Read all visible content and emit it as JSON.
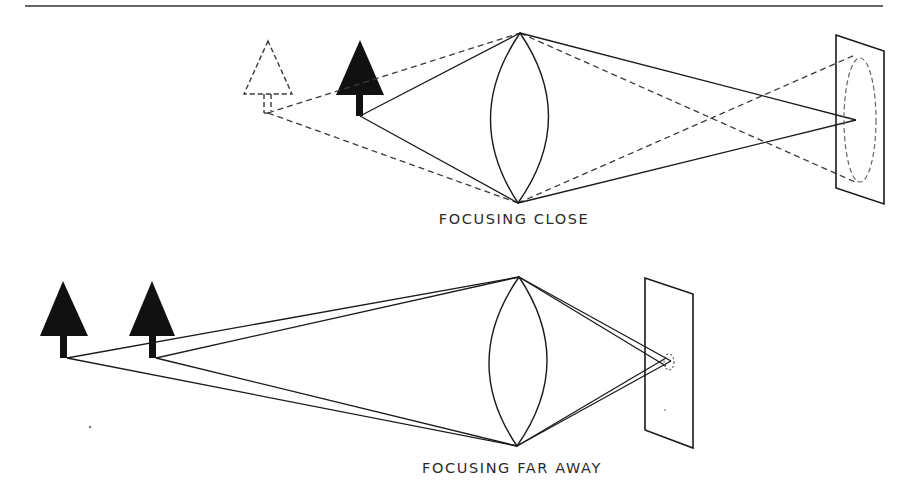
{
  "diagram": {
    "title_rule": true,
    "colors": {
      "ink": "#1a1a1a",
      "dashed_ink": "#3a3a3a",
      "background": "#ffffff"
    },
    "panels": [
      {
        "id": "close",
        "caption": "FOCUSING CLOSE",
        "objects": [
          {
            "name": "virtual-tree",
            "style": "dashed",
            "label": ""
          },
          {
            "name": "near-tree",
            "style": "solid",
            "label": ""
          }
        ],
        "lens": "convex-lens",
        "screen": "image-screen",
        "blur_circle": "large-dashed-ellipse"
      },
      {
        "id": "far",
        "caption": "FOCUSING FAR AWAY",
        "objects": [
          {
            "name": "far-tree-1",
            "style": "solid",
            "label": ""
          },
          {
            "name": "far-tree-2",
            "style": "solid",
            "label": ""
          }
        ],
        "lens": "convex-lens",
        "screen": "image-screen",
        "blur_circle": "small-dashed-ellipse"
      }
    ]
  }
}
